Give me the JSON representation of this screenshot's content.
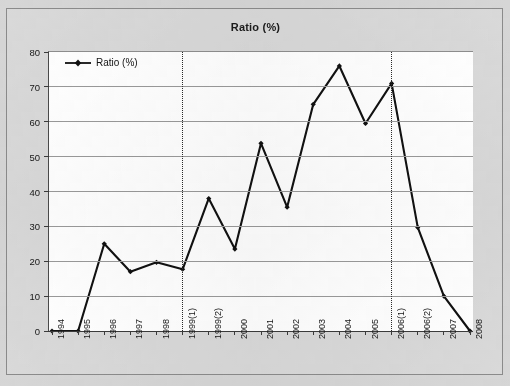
{
  "chart": {
    "title": "Ratio (%)",
    "legend_label": "Ratio (%)",
    "series_color": "#111111",
    "grid_color": "#9a9a9a",
    "axis_color": "#3b3b3b",
    "plot_background": "#ffffff",
    "frame_background": "#d9d9d9",
    "marker_shape": "diamond",
    "legend_position": "top-left-inside",
    "reference_lines": [
      {
        "name": "reference-line-1999",
        "at_category": "1999(1)",
        "style": "dotted"
      },
      {
        "name": "reference-line-2006",
        "at_category": "2006(1)",
        "style": "dotted"
      }
    ]
  },
  "chart_data": {
    "type": "line",
    "title": "Ratio (%)",
    "xlabel": "",
    "ylabel": "",
    "ylim": [
      0,
      80
    ],
    "ytick_step": 10,
    "yticks": [
      0,
      10,
      20,
      30,
      40,
      50,
      60,
      70,
      80
    ],
    "ytick_labels": [
      "0",
      "10",
      "20",
      "30",
      "40",
      "50",
      "60",
      "70",
      "80"
    ],
    "grid": true,
    "legend": [
      "Ratio (%)"
    ],
    "legend_position": "upper left",
    "categories": [
      "1994",
      "1995",
      "1996",
      "1997",
      "1998",
      "1999(1)",
      "1999(2)",
      "2000",
      "2001",
      "2002",
      "2003",
      "2004",
      "2005",
      "2006(1)",
      "2006(2)",
      "2007",
      "2008"
    ],
    "series": [
      {
        "name": "Ratio (%)",
        "values": [
          0,
          0,
          25,
          17,
          19.7,
          17.7,
          38,
          23.5,
          53.8,
          35.5,
          65,
          76,
          59.5,
          71,
          29.7,
          10,
          0
        ]
      }
    ],
    "annotations": [
      {
        "type": "vertical-dotted-line",
        "at": "1999(1)"
      },
      {
        "type": "vertical-dotted-line",
        "at": "2006(1)"
      }
    ]
  }
}
